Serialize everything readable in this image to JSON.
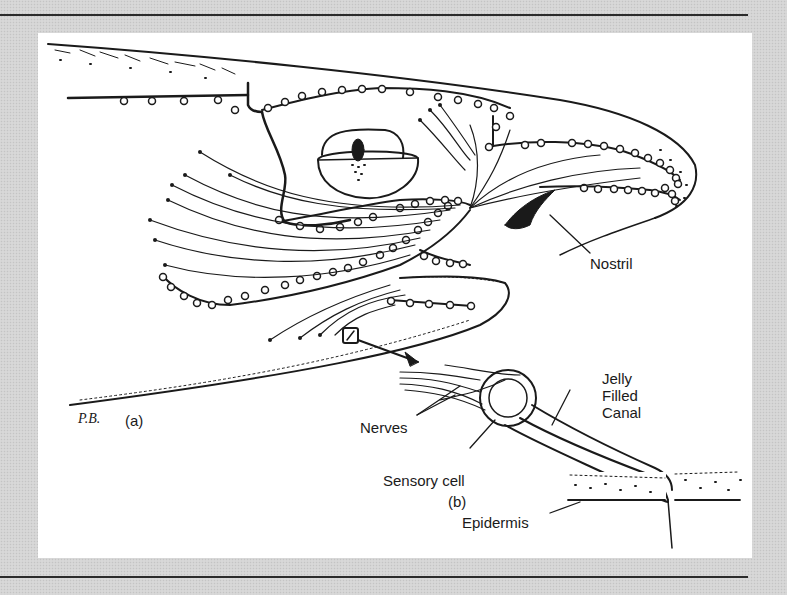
{
  "figure": {
    "subfigure_a": {
      "label": "(a)",
      "signature": "P.B.",
      "annotations": [
        {
          "id": "nostril",
          "text": "Nostril"
        }
      ]
    },
    "subfigure_b": {
      "label": "(b)",
      "annotations": [
        {
          "id": "jelly-filled-canal",
          "lines": [
            "Jelly",
            "Filled",
            "Canal"
          ]
        },
        {
          "id": "nerves",
          "text": "Nerves"
        },
        {
          "id": "sensory-cell",
          "text": "Sensory cell"
        },
        {
          "id": "epidermis",
          "text": "Epidermis"
        }
      ]
    }
  },
  "colors": {
    "ink": "#1a1a1a",
    "paper": "#ffffff",
    "frame": "#d4d4d4",
    "rule": "#2b2b2b"
  }
}
